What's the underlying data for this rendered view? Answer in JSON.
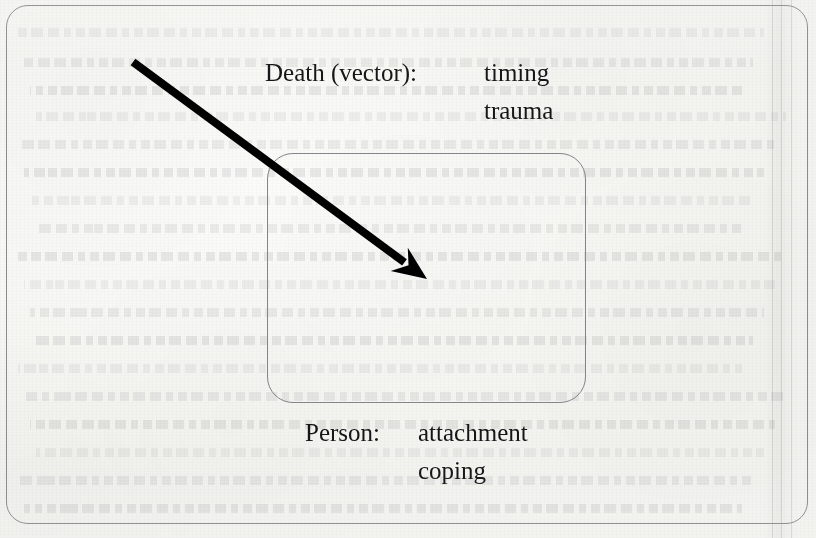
{
  "figure": {
    "type": "scanned-book-diagram",
    "background_color": "#f8f8f6",
    "ink_color": "#161619",
    "border_color": "#8a8a8d"
  },
  "outer_box": {
    "name": "outer-context-box",
    "border_color": "#8a8a8d"
  },
  "inner_box": {
    "name": "person-box",
    "border_color": "#84848a"
  },
  "arrow": {
    "name": "death-vector-arrow",
    "color": "#000000",
    "start_x": 133,
    "start_y": 62,
    "tip_x": 427,
    "tip_y": 279,
    "shaft_width": 8,
    "direction": "down-right"
  },
  "death_label": {
    "key": "Death (vector):",
    "values": [
      "timing",
      "trauma"
    ]
  },
  "person_label": {
    "key": "Person:",
    "values": [
      "attachment",
      "coping"
    ]
  },
  "ghost_text": {
    "note": "faint show-through text from reverse page",
    "line_tops": [
      28,
      58,
      86,
      112,
      140,
      168,
      196,
      224,
      252,
      280,
      308,
      336,
      364,
      392,
      420,
      448,
      476,
      504
    ],
    "opacity": 0.085
  },
  "gutter": {
    "line_positions": [
      772,
      781,
      791
    ]
  }
}
